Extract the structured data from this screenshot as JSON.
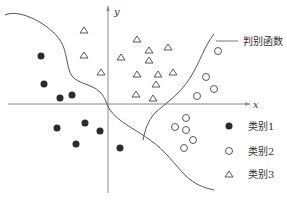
{
  "diagram": {
    "type": "classification-scatter-with-discriminant",
    "axes": {
      "x_label": "x",
      "y_label": "y"
    },
    "discriminant_label": "判别函数",
    "legend": [
      {
        "marker": "filled-circle",
        "label": "类别1"
      },
      {
        "marker": "hollow-circle",
        "label": "类别2"
      },
      {
        "marker": "triangle",
        "label": "类别3"
      }
    ],
    "colors": {
      "stroke": "#444444",
      "fill_dark": "#2b2b2b",
      "axis": "#888888",
      "background": "#ffffff"
    },
    "points": {
      "class1": [
        [
          41,
          56
        ],
        [
          44,
          84
        ],
        [
          60,
          98
        ],
        [
          72,
          95
        ],
        [
          57,
          128
        ],
        [
          85,
          123
        ],
        [
          100,
          131
        ],
        [
          76,
          144
        ],
        [
          120,
          148
        ]
      ],
      "class2": [
        [
          218,
          51
        ],
        [
          206,
          77
        ],
        [
          214,
          89
        ],
        [
          197,
          96
        ],
        [
          186,
          118
        ],
        [
          175,
          127
        ],
        [
          186,
          130
        ],
        [
          193,
          140
        ],
        [
          184,
          148
        ]
      ],
      "class3": [
        [
          84,
          30
        ],
        [
          84,
          55
        ],
        [
          101,
          72
        ],
        [
          137,
          39
        ],
        [
          121,
          57
        ],
        [
          149,
          60
        ],
        [
          137,
          74
        ],
        [
          158,
          74
        ],
        [
          149,
          50
        ],
        [
          153,
          98
        ],
        [
          168,
          47
        ],
        [
          173,
          72
        ],
        [
          136,
          94
        ],
        [
          156,
          84
        ]
      ]
    }
  }
}
